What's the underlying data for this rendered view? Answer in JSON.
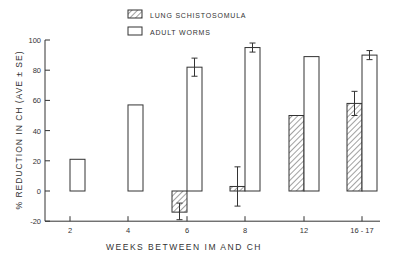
{
  "chart_data": {
    "type": "bar",
    "title": "",
    "xlabel": "WEEKS BETWEEN IM AND CH",
    "ylabel": "% REDUCTION IN CH (AVE ± SE)",
    "ylim": [
      -20,
      100
    ],
    "yticks": [
      -20,
      0,
      20,
      40,
      60,
      80,
      100
    ],
    "grid": false,
    "legend_position": "top-center",
    "categories": [
      "2",
      "4",
      "6",
      "8",
      "12",
      "16 - 17"
    ],
    "series": [
      {
        "name": "LUNG SCHISTOSOMULA",
        "pattern": "hatched",
        "values": [
          null,
          null,
          -14,
          3,
          50,
          58
        ],
        "error_low": [
          null,
          null,
          -19,
          -10,
          null,
          50
        ],
        "error_high": [
          null,
          null,
          -8,
          16,
          null,
          66
        ]
      },
      {
        "name": "ADULT WORMS",
        "pattern": "open",
        "values": [
          21,
          57,
          82,
          95,
          89,
          90
        ],
        "error_low": [
          null,
          null,
          76,
          92,
          null,
          87
        ],
        "error_high": [
          null,
          null,
          88,
          98,
          null,
          93
        ]
      }
    ]
  },
  "colors": {
    "stroke": "#333333",
    "background": "#ffffff"
  }
}
